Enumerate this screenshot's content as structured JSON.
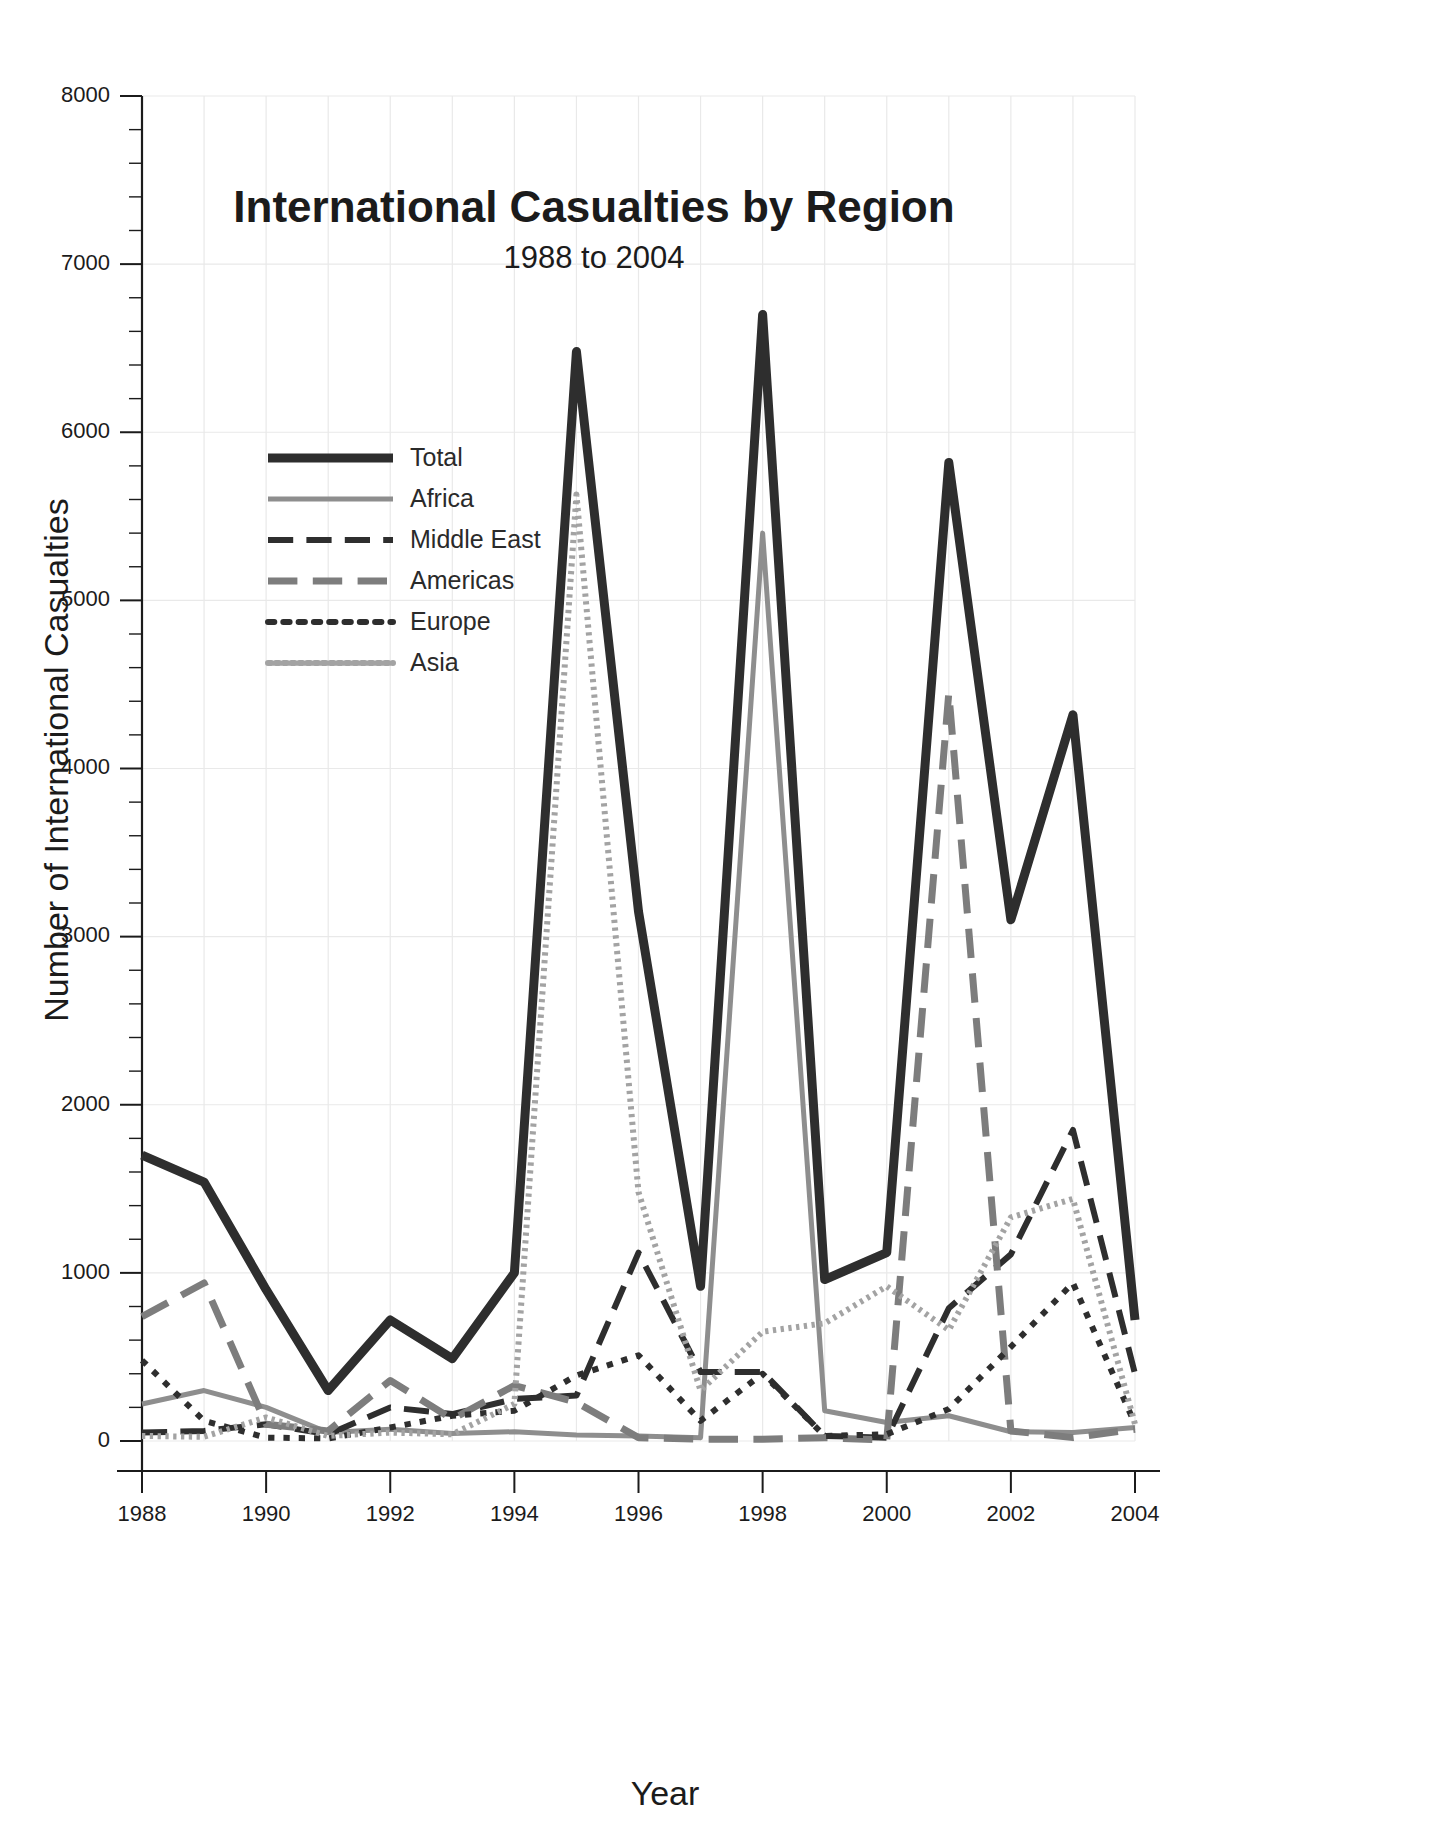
{
  "chart_data": {
    "type": "line",
    "title": "International Casualties by Region",
    "subtitle": "1988 to 2004",
    "xlabel": "Year",
    "ylabel": "Number of International Casualties",
    "x": [
      1988,
      1989,
      1990,
      1991,
      1992,
      1993,
      1994,
      1995,
      1996,
      1997,
      1998,
      1999,
      2000,
      2001,
      2002,
      2003,
      2004
    ],
    "xtick_labels": [
      "1988",
      "1990",
      "1992",
      "1994",
      "1996",
      "1998",
      "2000",
      "2002",
      "2004"
    ],
    "xtick_values": [
      1988,
      1990,
      1992,
      1994,
      1996,
      1998,
      2000,
      2002,
      2004
    ],
    "ytick_labels": [
      "0",
      "1000",
      "2000",
      "3000",
      "4000",
      "5000",
      "6000",
      "7000",
      "8000"
    ],
    "ytick_values": [
      0,
      1000,
      2000,
      3000,
      4000,
      5000,
      6000,
      7000,
      8000
    ],
    "xlim": [
      1988,
      2004
    ],
    "ylim": [
      0,
      8000
    ],
    "y_minor_step": 200,
    "grid": true,
    "legend_position": "upper-left-inside",
    "series": [
      {
        "name": "Total",
        "color": "#2e2e2e",
        "style": "solid",
        "width": 9,
        "values": [
          1700,
          1540,
          900,
          300,
          720,
          490,
          1000,
          6480,
          3150,
          920,
          6700,
          960,
          1120,
          5820,
          3100,
          4320,
          720
        ]
      },
      {
        "name": "Africa",
        "color": "#8e8e8e",
        "style": "solid",
        "width": 5,
        "values": [
          220,
          300,
          200,
          50,
          70,
          45,
          55,
          35,
          30,
          20,
          5400,
          180,
          110,
          150,
          55,
          50,
          80
        ]
      },
      {
        "name": "Middle East",
        "color": "#2e2e2e",
        "style": "dashed",
        "width": 6,
        "values": [
          50,
          60,
          100,
          40,
          200,
          160,
          250,
          270,
          1120,
          410,
          410,
          30,
          20,
          790,
          1110,
          1850,
          400
        ]
      },
      {
        "name": "Americas",
        "color": "#7d7d7d",
        "style": "dashed",
        "width": 7,
        "values": [
          740,
          940,
          100,
          60,
          360,
          130,
          330,
          230,
          20,
          10,
          10,
          20,
          5,
          4450,
          60,
          20,
          70
        ]
      },
      {
        "name": "Europe",
        "color": "#2e2e2e",
        "style": "dotted",
        "width": 6,
        "values": [
          480,
          120,
          20,
          15,
          80,
          150,
          180,
          390,
          510,
          120,
          400,
          30,
          40,
          190,
          560,
          940,
          100
        ]
      },
      {
        "name": "Asia",
        "color": "#a3a3a3",
        "style": "fine-dotted",
        "width": 6,
        "values": [
          30,
          25,
          140,
          30,
          50,
          40,
          220,
          5630,
          1480,
          300,
          650,
          700,
          920,
          660,
          1330,
          1440,
          100
        ]
      }
    ]
  }
}
